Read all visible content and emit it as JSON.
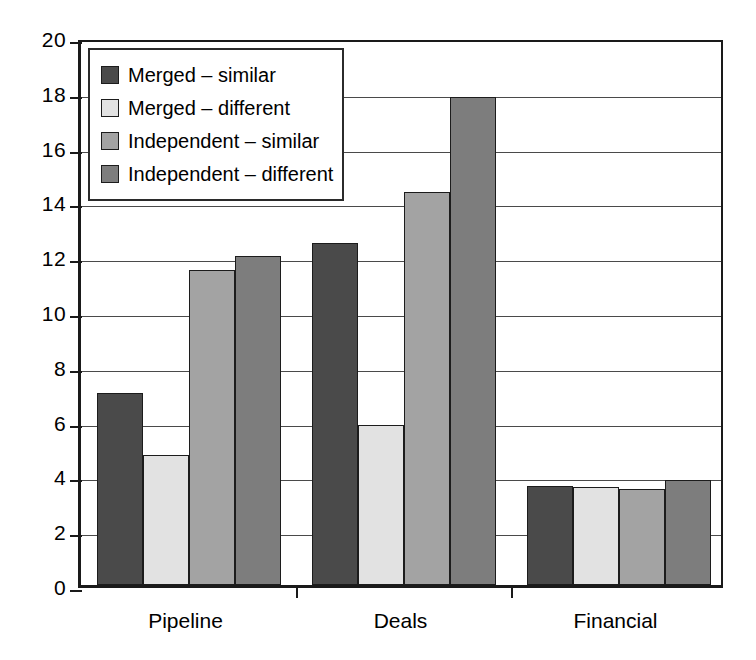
{
  "chart_data": {
    "type": "bar",
    "title": "",
    "subtitle": "",
    "xlabel": "",
    "ylabel": "",
    "categories": [
      "Pipeline",
      "Deals",
      "Financial"
    ],
    "series": [
      {
        "name": "Merged – similar",
        "color": "#4a4a4a",
        "values": [
          7.0,
          12.5,
          3.63
        ]
      },
      {
        "name": "Merged – different",
        "color": "#e2e2e2",
        "values": [
          4.74,
          5.85,
          3.58
        ]
      },
      {
        "name": "Independent – similar",
        "color": "#a3a3a3",
        "values": [
          11.5,
          14.35,
          3.52
        ]
      },
      {
        "name": "Independent – different",
        "color": "#7d7d7d",
        "values": [
          12.0,
          17.8,
          3.85
        ]
      }
    ],
    "ylim": [
      0,
      20
    ],
    "ytick_step": 2,
    "yticks": [
      0,
      2,
      4,
      6,
      8,
      10,
      12,
      14,
      16,
      18,
      20
    ],
    "ytick_labels": [
      "0",
      "2",
      "4",
      "6",
      "8",
      "10",
      "12",
      "14",
      "16",
      "18",
      "20"
    ],
    "grid": true,
    "grid_axis": "y",
    "legend_position": "top-left",
    "legend_entries": [
      "Merged – similar",
      "Merged – different",
      "Independent – similar",
      "Independent – different"
    ],
    "annotations": []
  },
  "colors": {
    "axis": "#1a1a1a",
    "gridline": "#4a4a4a",
    "background": "#ffffff",
    "bar_outline": "#1c1c1c",
    "series_1": "#4a4a4a",
    "series_2": "#e2e2e2",
    "series_3": "#a3a3a3",
    "series_4": "#7d7d7d"
  }
}
